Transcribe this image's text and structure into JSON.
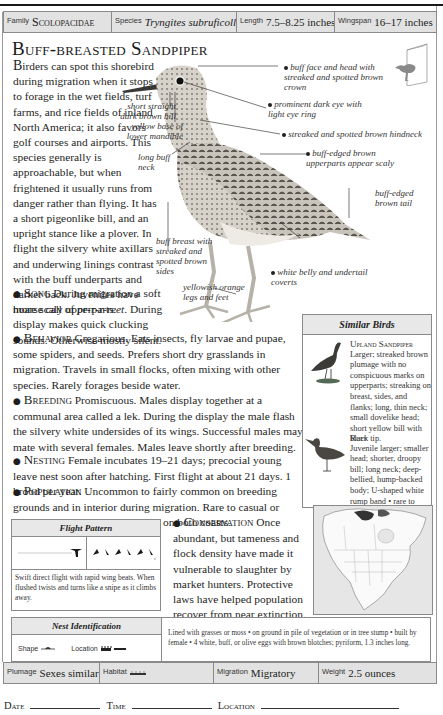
{
  "info_top": {
    "family": {
      "label": "Family",
      "value": "Scolopacidae"
    },
    "species": {
      "label": "Species",
      "value": "Tryngites subruficollis"
    },
    "length": {
      "label": "Length",
      "value": "7.5–8.25 inches"
    },
    "wingspan": {
      "label": "Wingspan",
      "value": "16–17 inches"
    }
  },
  "title": "Buff-breasted Sandpiper",
  "intro": {
    "dropcap": "B",
    "text": "irders can spot this shorebird during migration when it stops to forage in the wet fields, turf farms, and rice fields of inland North America; it also favors golf courses and airports. This species generally is approachable, but when frightened it usually runs from danger rather than flying. It has a short pigeonlike bill, and an upright stance like a plover. In flight the silvery white axillars and underwing linings contrast with the buff underparts and darker back. Juveniles have more scaly upperparts."
  },
  "sections": {
    "song": {
      "head": "Song",
      "text": " During migration a soft hoarse call of ",
      "call": "pr-r-r-reet",
      "text2": ". During display makes quick clucking sounds. Otherwise mostly silent."
    },
    "behavior": {
      "head": "Behavior",
      "text": " Gregarious. Eats insects, fly larvae and pupae, some spiders, and seeds. Prefers short dry grasslands in migration. Travels in small flocks, often mixing with other species. Rarely forages beside water."
    },
    "breeding": {
      "head": "Breeding",
      "text": " Promiscuous. Males display together at a communal area called a lek. During the display the male flash the silvery white undersides of its wings. Successful males may mate with several females. Males leave shortly after breeding."
    },
    "nesting": {
      "head": "Nesting",
      "text": " Female incubates 19–21 days; precocial young leave nest soon after hatching. First flight at about 21 days. 1 brood per year."
    },
    "population": {
      "head": "Population",
      "text": " Uncommon to fairly common on breeding grounds and in interior during migration. Rare to casual or uncommon in autumn migration on both coasts."
    },
    "conservation": {
      "head": "Conservation",
      "text": "  Once abundant, but tameness and flock density have made it vulnerable to slaughter by market hunters. Protective laws have helped population recover from near extinction."
    }
  },
  "bird_labels": {
    "face": "buff face and head with streaked and spotted brown crown",
    "eye": "prominent dark eye with light eye ring",
    "hindneck": "streaked and spotted brown hindneck",
    "upperparts": "buff-edged brown upperparts appear scaly",
    "tail": "buff-edged brown tail",
    "bill": "short straight dark brown bill",
    "mandible": "yellow base of lower mandible",
    "neck": "long buff neck",
    "breast": "buff breast with streaked and spotted brown sides",
    "belly": "white belly and undertail coverts",
    "legs": "yellowish orange legs and feet"
  },
  "similar_birds": {
    "heading": "Similar Birds",
    "birds": [
      {
        "name": "Upland Sandpiper",
        "text": "Larger; streaked brown plumage with no conspicuous marks on upperparts; streaking on breast, sides, and flanks; long, thin neck; small dovelike head; short yellow bill with black tip."
      },
      {
        "name": "Ruff",
        "text": "Juvenile larger; smaller head; shorter, droopy bill; long neck; deep-bellied, hump-backed body; U-shaped white rump band • rare to casual."
      }
    ]
  },
  "flight_pattern": {
    "heading": "Flight Pattern",
    "description": "Swift direct flight with rapid wing beats. When flushed twists and turns like a snipe as it climbs away."
  },
  "nest_identification": {
    "heading": "Nest Identification",
    "shape_label": "Shape",
    "location_label": "Location",
    "description": "Lined with grasses or moss • on ground in pile of vegetation or in tree stump • built by female • 4 white, buff, or olive eggs with brown blotches; pyriform, 1.3 inches long."
  },
  "info_bottom": {
    "plumage": {
      "label": "Plumage",
      "value": "Sexes similar"
    },
    "habitat": {
      "label": "Habitat",
      "value": ""
    },
    "migration": {
      "label": "Migration",
      "value": "Migratory"
    },
    "weight": {
      "label": "Weight",
      "value": "2.5 ounces"
    }
  },
  "footer": {
    "date": "Date",
    "time": "Time",
    "location": "Location"
  }
}
